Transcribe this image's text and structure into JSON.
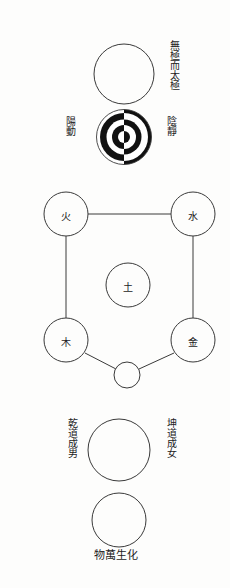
{
  "diagram": {
    "background_color": "#fdfdfc",
    "stroke_color": "#3a3a3a",
    "ink_color": "#111111"
  },
  "labels": {
    "wuji_er_taiji": "無極而太極",
    "yang_dong": "陽動",
    "yin_jing": "陰靜",
    "qian_dao_cheng_nan": "乾道成男",
    "kun_dao_cheng_nv": "坤道成女",
    "wu_wan_sheng_hua": "物萬生化"
  },
  "five_elements": {
    "fire": "火",
    "water": "水",
    "earth": "土",
    "wood": "木",
    "metal": "金"
  },
  "circles": {
    "wuji_circle": {
      "cx": 124,
      "cy": 74,
      "r": 30
    },
    "taiji_circle": {
      "cx": 124,
      "cy": 137,
      "r": 28,
      "rings": 3
    },
    "fire_circle": {
      "cx": 66,
      "cy": 214,
      "r": 22
    },
    "water_circle": {
      "cx": 193,
      "cy": 214,
      "r": 22
    },
    "earth_circle": {
      "cx": 128,
      "cy": 285,
      "r": 22
    },
    "wood_circle": {
      "cx": 66,
      "cy": 340,
      "r": 22
    },
    "metal_circle": {
      "cx": 193,
      "cy": 340,
      "r": 22
    },
    "union_circle": {
      "cx": 127,
      "cy": 375,
      "r": 13
    },
    "male_female_circle": {
      "cx": 119,
      "cy": 450,
      "r": 31
    },
    "myriad_things_circle": {
      "cx": 119,
      "cy": 520,
      "r": 27
    }
  },
  "connections": [
    {
      "from": "fire",
      "to": "water",
      "kind": "horizontal"
    },
    {
      "from": "fire",
      "to": "wood",
      "kind": "vertical"
    },
    {
      "from": "water",
      "to": "metal",
      "kind": "vertical"
    },
    {
      "from": "wood",
      "to": "union",
      "kind": "diagonal"
    },
    {
      "from": "metal",
      "to": "union",
      "kind": "diagonal"
    }
  ]
}
